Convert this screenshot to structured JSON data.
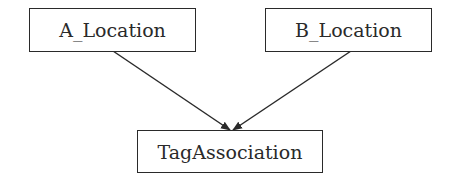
{
  "diagram": {
    "nodes": [
      {
        "id": "a",
        "label": "A_Location"
      },
      {
        "id": "b",
        "label": "B_Location"
      },
      {
        "id": "tag",
        "label": "TagAssociation"
      }
    ],
    "edges": [
      {
        "from": "A_Location",
        "to": "TagAssociation"
      },
      {
        "from": "B_Location",
        "to": "TagAssociation"
      }
    ]
  }
}
